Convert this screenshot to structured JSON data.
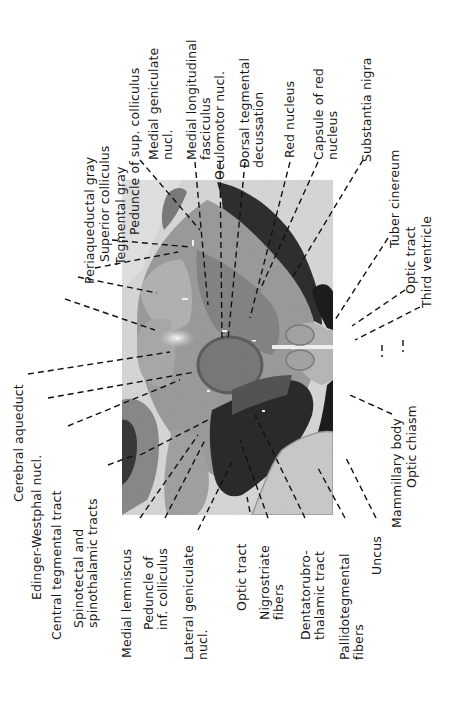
{
  "figure": {
    "orientation": "rotated -90deg (text reads bottom-to-top)",
    "photo_subject": "Transverse section of human midbrain at level of superior colliculus and red nucleus (myelin stain)"
  },
  "labels_top": [
    {
      "id": "periaqueductal-gray",
      "text": "Periaqueductal gray"
    },
    {
      "id": "superior-colliculus",
      "text": "Superior colliculus"
    },
    {
      "id": "tegmental-gray",
      "text": "Tegmental gray"
    },
    {
      "id": "peduncle-sup-colliculus",
      "text": "Peduncle of sup. colliculus"
    },
    {
      "id": "medial-geniculate",
      "text": "Medial geniculate\nnucl."
    },
    {
      "id": "medial-longitudinal-fasciculus",
      "text": "Medial longitudinal\nfasciculus"
    },
    {
      "id": "oculomotor-nucl",
      "text": "Oculomotor nucl."
    },
    {
      "id": "dorsal-tegmental-decussation",
      "text": "Dorsal tegmental\ndecussation"
    },
    {
      "id": "red-nucleus",
      "text": "Red nucleus"
    },
    {
      "id": "capsule-red-nucleus",
      "text": "Capsule of red\nnucleus"
    },
    {
      "id": "substantia-nigra",
      "text": "Substantia nigra"
    },
    {
      "id": "tuber-cinereum",
      "text": "Tuber cinereum"
    },
    {
      "id": "optic-tract-right",
      "text": "Optic tract"
    },
    {
      "id": "third-ventricle",
      "text": "Third ventricle"
    }
  ],
  "labels_left": [
    {
      "id": "cerebral-aqueduct",
      "text": "Cerebral aqueduct"
    },
    {
      "id": "edinger-westphal",
      "text": "Edinger-Westphal nucl."
    },
    {
      "id": "central-tegmental-tract",
      "text": "Central tegmental tract"
    },
    {
      "id": "spinotectal-spinothalamic",
      "text": "Spinotectal and\nspinothalamic tracts"
    }
  ],
  "labels_bottom": [
    {
      "id": "medial-lemniscus",
      "text": "Medial lemniscus"
    },
    {
      "id": "peduncle-inf-colliculus",
      "text": "Peduncle of\ninf. colliculus"
    },
    {
      "id": "lateral-geniculate",
      "text": "Lateral geniculate\nnucl."
    },
    {
      "id": "optic-tract-bottom",
      "text": "Optic tract"
    },
    {
      "id": "nigrostriate-fibers",
      "text": "Nigrostriate\nfibers"
    },
    {
      "id": "dentatorubrothalamic",
      "text": "Dentatorubro-\nthalamic tract"
    },
    {
      "id": "pallidotegmental",
      "text": "Pallidotegmental\nfibers"
    },
    {
      "id": "uncus",
      "text": "Uncus"
    },
    {
      "id": "mammillary-body",
      "text": "Mammillary body"
    },
    {
      "id": "optic-chiasm",
      "text": "Optic chiasm"
    }
  ],
  "colors": {
    "background": "#ffffff",
    "photo_bg": "#d6d6d6",
    "tissue_light": "#bdbdbd",
    "tissue_mid": "#8f8f8f",
    "tissue_dark": "#2a2a2a",
    "leader_line": "#111111",
    "text": "#161616"
  }
}
